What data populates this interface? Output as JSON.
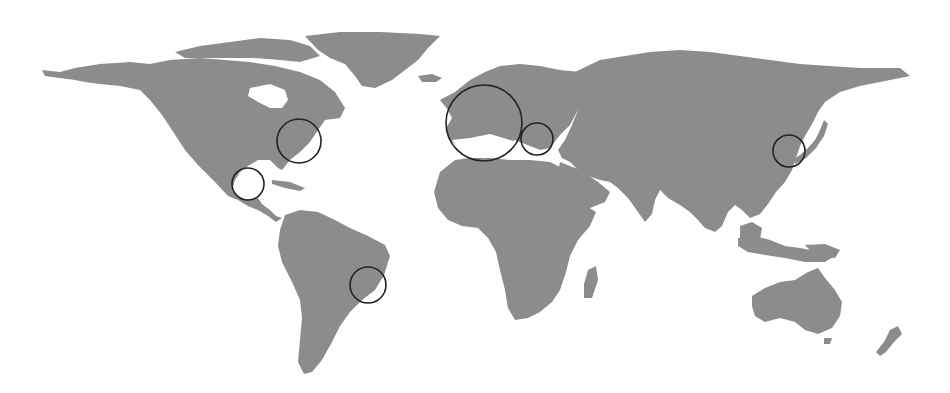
{
  "map": {
    "projection": "world (equirectangular-like)",
    "colors": {
      "land": "#8c8c8c",
      "water": "#ffffff",
      "marker_stroke": "#222222"
    },
    "markers": [
      {
        "id": "europe-west",
        "region": "Western Europe",
        "cx": 484,
        "cy": 123,
        "r": 38
      },
      {
        "id": "east-mediterranean",
        "region": "Greece / Turkey",
        "cx": 537,
        "cy": 139,
        "r": 16
      },
      {
        "id": "us-east-coast",
        "region": "Eastern United States",
        "cx": 299,
        "cy": 141,
        "r": 22
      },
      {
        "id": "gulf-of-mexico",
        "region": "Mexico / Gulf",
        "cx": 248,
        "cy": 184,
        "r": 16
      },
      {
        "id": "brazil-southeast",
        "region": "Southeastern Brazil",
        "cx": 368,
        "cy": 285,
        "r": 18
      },
      {
        "id": "korea-japan",
        "region": "Korea / Japan",
        "cx": 789,
        "cy": 151,
        "r": 16
      }
    ]
  }
}
